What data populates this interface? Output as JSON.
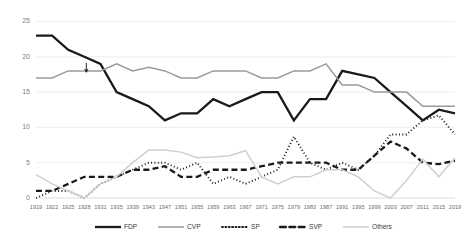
{
  "chart_data": {
    "type": "line",
    "title": "",
    "subtitle": "",
    "xlabel": "",
    "ylabel": "",
    "ylim": [
      0,
      25
    ],
    "yticks": [
      0,
      5,
      10,
      15,
      20,
      25
    ],
    "ytick_labels": [
      "0",
      "5",
      "10",
      "15",
      "20",
      "25"
    ],
    "grid": true,
    "legend_position": "bottom",
    "categories": [
      "1919",
      "1922",
      "1925",
      "1928",
      "1931",
      "1935",
      "1939",
      "1943",
      "1947",
      "1951",
      "1955",
      "1959",
      "1963",
      "1967",
      "1971",
      "1975",
      "1979",
      "1983",
      "1987",
      "1991",
      "1995",
      "1999",
      "2003",
      "2007",
      "2011",
      "2015",
      "2019"
    ],
    "series": [
      {
        "name": "FDP",
        "color": "#1a1a1a",
        "style": "solid",
        "width": 2.3,
        "values": [
          23,
          23,
          21,
          20,
          19,
          15,
          14,
          13,
          11,
          12,
          12,
          14,
          13,
          14,
          15,
          15,
          11,
          14,
          14,
          18,
          17.5,
          17,
          15,
          13,
          11,
          12.5,
          12
        ]
      },
      {
        "name": "CVP",
        "color": "#9a9a9a",
        "style": "solid",
        "width": 1.5,
        "values": [
          17,
          17,
          18,
          18,
          18,
          19,
          18,
          18.5,
          18,
          17,
          17,
          18,
          18,
          18,
          17,
          17,
          18,
          18,
          19,
          16,
          16,
          15,
          15,
          15,
          13,
          13,
          13
        ]
      },
      {
        "name": "SP",
        "color": "#1a1a1a",
        "style": "dotted",
        "width": 1.9,
        "values": [
          0,
          1,
          1,
          0,
          2,
          3,
          4,
          5,
          5,
          4,
          5,
          2,
          3,
          2,
          3,
          4,
          8.7,
          5,
          4,
          5,
          4,
          6,
          9,
          9,
          11,
          11.7,
          9
        ]
      },
      {
        "name": "SVP",
        "color": "#1a1a1a",
        "style": "dashed",
        "width": 2.3,
        "values": [
          1,
          1,
          2,
          3,
          3,
          3,
          4,
          4,
          4.5,
          3,
          3,
          4,
          4,
          4,
          4.5,
          5,
          5,
          5,
          5,
          4,
          4,
          6,
          8,
          7,
          5,
          4.8,
          5.3
        ]
      },
      {
        "name": "Others",
        "color": "#cfcfcf",
        "style": "solid",
        "width": 1.5,
        "values": [
          3.3,
          2,
          1,
          0,
          2,
          3,
          5,
          6.8,
          6.8,
          6.5,
          5.7,
          5.8,
          6,
          6.7,
          3,
          2,
          3,
          3,
          4,
          4,
          3,
          1,
          0,
          2.5,
          5.5,
          3,
          5.7
        ]
      }
    ]
  },
  "legend": {
    "items": [
      {
        "label": "FDP"
      },
      {
        "label": "CVP"
      },
      {
        "label": "SP"
      },
      {
        "label": "SVP"
      },
      {
        "label": "Others"
      }
    ]
  },
  "annotation": {
    "name": "down-arrow-marker",
    "category": "1928",
    "value": 18
  }
}
